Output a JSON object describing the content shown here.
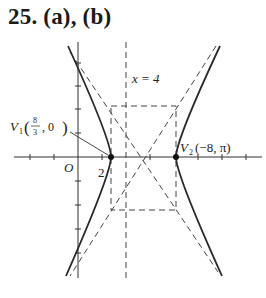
{
  "title": "25. (a), (b)",
  "diagram": {
    "type": "hyperbola-plot",
    "axes": {
      "origin_label": "O",
      "x_tick_label": "2"
    },
    "directrix_label": "x = 4",
    "vertex1": {
      "name": "V",
      "sub": "1",
      "coords_num": "8",
      "coords_den": "3",
      "coords_rest": ", 0"
    },
    "vertex2": {
      "name": "V",
      "sub": "2",
      "coords": "(−8, π)"
    }
  },
  "colors": {
    "ink": "#222222",
    "dashed": "#444444"
  }
}
